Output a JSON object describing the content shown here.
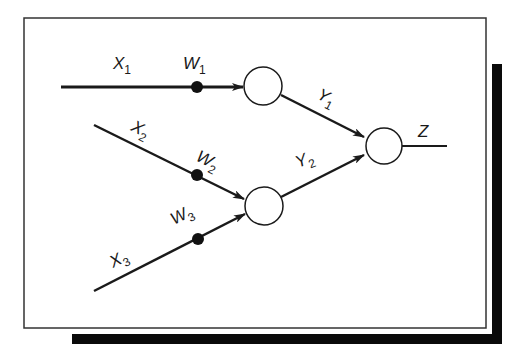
{
  "diagram": {
    "type": "neural-network",
    "colors": {
      "stroke": "#1a1a1a",
      "background": "#ffffff",
      "shadow": "#0a0a0a"
    },
    "inputs": [
      {
        "name": "X",
        "sub": "1",
        "weight": "W",
        "weight_sub": "1"
      },
      {
        "name": "X",
        "sub": "2",
        "weight": "W",
        "weight_sub": "2"
      },
      {
        "name": "X",
        "sub": "3",
        "weight": "W",
        "weight_sub": "3"
      }
    ],
    "hidden": [
      {
        "out": "Y",
        "out_sub": "1"
      },
      {
        "out": "Y",
        "out_sub": "2"
      }
    ],
    "output": {
      "name": "Z"
    }
  }
}
